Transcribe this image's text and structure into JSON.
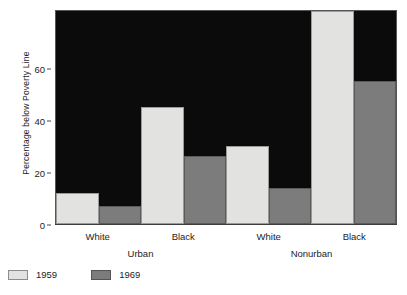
{
  "chart_data": {
    "type": "bar",
    "title": "",
    "xlabel": "",
    "ylabel": "Percentage below Poverty Line",
    "ylim": [
      0,
      82
    ],
    "yticks": [
      0,
      20,
      40,
      60
    ],
    "ytick_labels": [
      "0",
      "20",
      "40",
      "60"
    ],
    "grid": false,
    "legend_position": "below-left",
    "categories": [
      "White",
      "Black",
      "White",
      "Black"
    ],
    "group_labels": [
      "Urban",
      "Nonurban"
    ],
    "series": [
      {
        "name": "1959",
        "color": "#e2e2e0",
        "values": [
          12,
          45,
          30,
          82
        ]
      },
      {
        "name": "1969",
        "color": "#7c7c7c",
        "values": [
          7,
          26,
          14,
          55
        ]
      }
    ],
    "bars": [
      {
        "group": "Urban",
        "category": "White",
        "series": "1959",
        "value": 12,
        "clipped": false
      },
      {
        "group": "Urban",
        "category": "White",
        "series": "1969",
        "value": 7,
        "clipped": false
      },
      {
        "group": "Urban",
        "category": "Black",
        "series": "1959",
        "value": 45,
        "clipped": false
      },
      {
        "group": "Urban",
        "category": "Black",
        "series": "1969",
        "value": 26,
        "clipped": false
      },
      {
        "group": "Nonurban",
        "category": "White",
        "series": "1959",
        "value": 30,
        "clipped": false
      },
      {
        "group": "Nonurban",
        "category": "White",
        "series": "1969",
        "value": 14,
        "clipped": false
      },
      {
        "group": "Nonurban",
        "category": "Black",
        "series": "1959",
        "value": 82,
        "clipped": true
      },
      {
        "group": "Nonurban",
        "category": "Black",
        "series": "1969",
        "value": 55,
        "clipped": false
      }
    ],
    "plot_background": "#0b0b0b",
    "page_background": "#ffffff"
  },
  "axis": {
    "y_title": "Percentage below Poverty Line",
    "ticks": [
      {
        "label": "60",
        "value": 60
      },
      {
        "label": "40",
        "value": 40
      },
      {
        "label": "20",
        "value": 20
      },
      {
        "label": "0",
        "value": 0
      }
    ]
  },
  "x_axis": {
    "tick_labels": [
      "White",
      "Black",
      "White",
      "Black"
    ],
    "groups": [
      "Urban",
      "Nonurban"
    ]
  },
  "legend": {
    "items": [
      {
        "label": "1959",
        "color": "#e2e2e0"
      },
      {
        "label": "1969",
        "color": "#7c7c7c"
      }
    ]
  }
}
